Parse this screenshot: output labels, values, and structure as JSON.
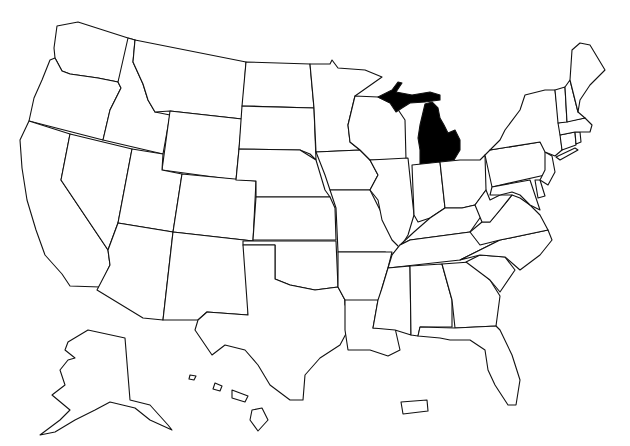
{
  "map": {
    "type": "choropleth-outline",
    "region": "United States",
    "background": "#ffffff",
    "stroke_color": "#111111",
    "default_fill": "#ffffff",
    "highlight_fill": "#000000",
    "highlighted_states": [
      "Michigan"
    ],
    "insets": [
      "Alaska",
      "Hawaii",
      "Puerto Rico"
    ],
    "states": [
      {
        "id": "WA",
        "name": "Washington",
        "highlighted": false
      },
      {
        "id": "OR",
        "name": "Oregon",
        "highlighted": false
      },
      {
        "id": "CA",
        "name": "California",
        "highlighted": false
      },
      {
        "id": "ID",
        "name": "Idaho",
        "highlighted": false
      },
      {
        "id": "NV",
        "name": "Nevada",
        "highlighted": false
      },
      {
        "id": "MT",
        "name": "Montana",
        "highlighted": false
      },
      {
        "id": "WY",
        "name": "Wyoming",
        "highlighted": false
      },
      {
        "id": "UT",
        "name": "Utah",
        "highlighted": false
      },
      {
        "id": "AZ",
        "name": "Arizona",
        "highlighted": false
      },
      {
        "id": "CO",
        "name": "Colorado",
        "highlighted": false
      },
      {
        "id": "NM",
        "name": "New Mexico",
        "highlighted": false
      },
      {
        "id": "ND",
        "name": "North Dakota",
        "highlighted": false
      },
      {
        "id": "SD",
        "name": "South Dakota",
        "highlighted": false
      },
      {
        "id": "NE",
        "name": "Nebraska",
        "highlighted": false
      },
      {
        "id": "KS",
        "name": "Kansas",
        "highlighted": false
      },
      {
        "id": "OK",
        "name": "Oklahoma",
        "highlighted": false
      },
      {
        "id": "TX",
        "name": "Texas",
        "highlighted": false
      },
      {
        "id": "MN",
        "name": "Minnesota",
        "highlighted": false
      },
      {
        "id": "IA",
        "name": "Iowa",
        "highlighted": false
      },
      {
        "id": "MO",
        "name": "Missouri",
        "highlighted": false
      },
      {
        "id": "AR",
        "name": "Arkansas",
        "highlighted": false
      },
      {
        "id": "LA",
        "name": "Louisiana",
        "highlighted": false
      },
      {
        "id": "WI",
        "name": "Wisconsin",
        "highlighted": false
      },
      {
        "id": "IL",
        "name": "Illinois",
        "highlighted": false
      },
      {
        "id": "MI",
        "name": "Michigan",
        "highlighted": true
      },
      {
        "id": "IN",
        "name": "Indiana",
        "highlighted": false
      },
      {
        "id": "OH",
        "name": "Ohio",
        "highlighted": false
      },
      {
        "id": "KY",
        "name": "Kentucky",
        "highlighted": false
      },
      {
        "id": "TN",
        "name": "Tennessee",
        "highlighted": false
      },
      {
        "id": "MS",
        "name": "Mississippi",
        "highlighted": false
      },
      {
        "id": "AL",
        "name": "Alabama",
        "highlighted": false
      },
      {
        "id": "GA",
        "name": "Georgia",
        "highlighted": false
      },
      {
        "id": "FL",
        "name": "Florida",
        "highlighted": false
      },
      {
        "id": "SC",
        "name": "South Carolina",
        "highlighted": false
      },
      {
        "id": "NC",
        "name": "North Carolina",
        "highlighted": false
      },
      {
        "id": "VA",
        "name": "Virginia",
        "highlighted": false
      },
      {
        "id": "WV",
        "name": "West Virginia",
        "highlighted": false
      },
      {
        "id": "MD",
        "name": "Maryland",
        "highlighted": false
      },
      {
        "id": "DE",
        "name": "Delaware",
        "highlighted": false
      },
      {
        "id": "PA",
        "name": "Pennsylvania",
        "highlighted": false
      },
      {
        "id": "NJ",
        "name": "New Jersey",
        "highlighted": false
      },
      {
        "id": "NY",
        "name": "New York",
        "highlighted": false
      },
      {
        "id": "CT",
        "name": "Connecticut",
        "highlighted": false
      },
      {
        "id": "RI",
        "name": "Rhode Island",
        "highlighted": false
      },
      {
        "id": "MA",
        "name": "Massachusetts",
        "highlighted": false
      },
      {
        "id": "VT",
        "name": "Vermont",
        "highlighted": false
      },
      {
        "id": "NH",
        "name": "New Hampshire",
        "highlighted": false
      },
      {
        "id": "ME",
        "name": "Maine",
        "highlighted": false
      },
      {
        "id": "AK",
        "name": "Alaska",
        "highlighted": false
      },
      {
        "id": "HI",
        "name": "Hawaii",
        "highlighted": false
      },
      {
        "id": "PR",
        "name": "Puerto Rico",
        "highlighted": false
      }
    ]
  }
}
